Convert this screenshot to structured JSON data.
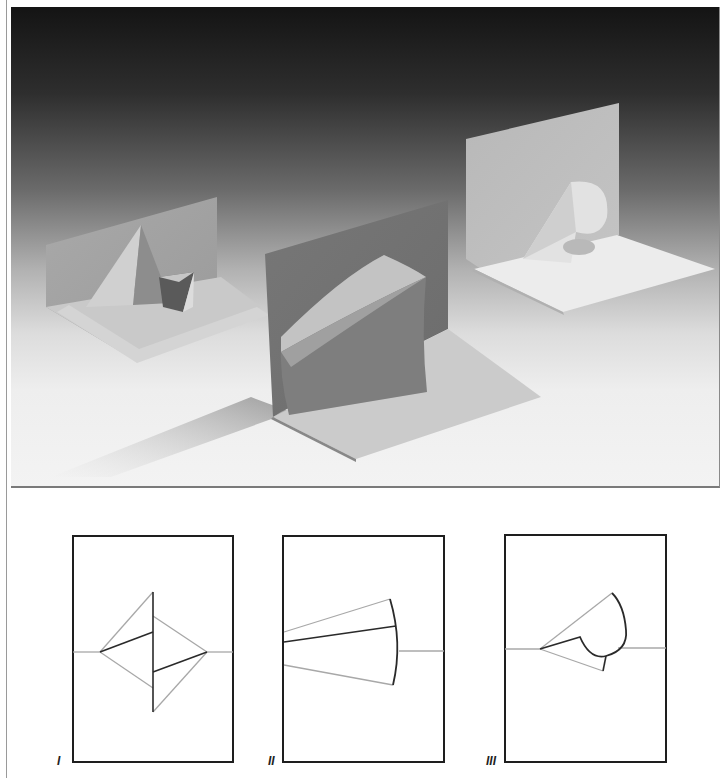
{
  "figure": {
    "photo": {
      "description": "Photograph of three white paper pop-up cards, each opened at 90 degrees, on a white surface against a dark-to-light gray gradient background",
      "cards": [
        {
          "id": "I",
          "shape": "double triangular pyramid pop-up"
        },
        {
          "id": "II",
          "shape": "curved fan / cone sector pop-up"
        },
        {
          "id": "III",
          "shape": "rounded petal / leaf pop-up"
        }
      ]
    },
    "diagrams": [
      {
        "label": "I",
        "description": "Crease pattern: two opposed triangles straddling the center fold with a vertical cut line"
      },
      {
        "label": "II",
        "description": "Crease pattern: fan-shaped sector cut from the left edge with a curved right boundary"
      },
      {
        "label": "III",
        "description": "Crease pattern: triangular wedge ending in a rounded teardrop cut"
      }
    ]
  },
  "colors": {
    "cut_line": "#2a2a2a",
    "fold_line": "#a8a8a8",
    "frame": "#1e1e1e"
  }
}
